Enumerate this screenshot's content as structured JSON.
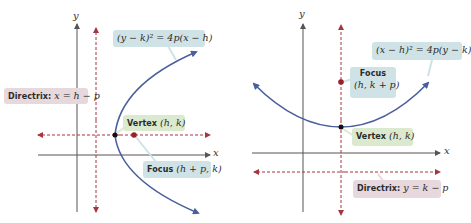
{
  "colors": {
    "parabola": "#4a5f9c",
    "axes": "#555555",
    "dashed": "#a8343f",
    "vertex_dot": "#111111",
    "focus_dot": "#9b1e2a",
    "label_teal": "#cfe3e6",
    "label_green": "#dbe9cf",
    "label_pink": "#e6d8dc"
  },
  "left_diagram": {
    "orientation": "opens-right",
    "axis_x_label": "x",
    "axis_y_label": "y",
    "equation": "(y − k)² = 4p(x − h)",
    "directrix": {
      "prefix": "Directrix:",
      "expr": "x = h − p"
    },
    "vertex": {
      "prefix": "Vertex",
      "expr": "(h, k)"
    },
    "focus": {
      "prefix": "Focus",
      "expr": "(h + p, k)"
    }
  },
  "right_diagram": {
    "orientation": "opens-up",
    "axis_x_label": "x",
    "axis_y_label": "y",
    "equation": "(x − h)² = 4p(y − k)",
    "focus": {
      "prefix": "Focus",
      "expr": "(h, k + p)"
    },
    "vertex": {
      "prefix": "Vertex",
      "expr": "(h, k)"
    },
    "directrix": {
      "prefix": "Directrix:",
      "expr": "y = k − p"
    }
  }
}
